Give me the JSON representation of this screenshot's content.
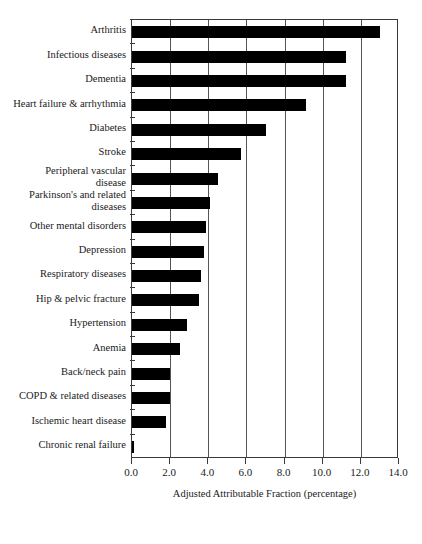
{
  "chart_data": {
    "type": "bar",
    "orientation": "horizontal",
    "title": "",
    "xlabel": "Adjusted Attributable Fraction (percentage)",
    "ylabel": "",
    "xlim": [
      0.0,
      14.0
    ],
    "xticks": [
      "0.0",
      "2.0",
      "4.0",
      "6.0",
      "8.0",
      "10.0",
      "12.0",
      "14.0"
    ],
    "xtick_values": [
      0.0,
      2.0,
      4.0,
      6.0,
      8.0,
      10.0,
      12.0,
      14.0
    ],
    "grid": "vertical",
    "legend": "none",
    "bar_color": "#000000",
    "categories": [
      "Arthritis",
      "Infectious diseases",
      "Dementia",
      "Heart failure & arrhythmia",
      "Diabetes",
      "Stroke",
      "Peripheral vascular\ndisease",
      "Parkinson's and related\ndiseases",
      "Other mental disorders",
      "Depression",
      "Respiratory diseases",
      "Hip & pelvic fracture",
      "Hypertension",
      "Anemia",
      "Back/neck pain",
      "COPD & related diseases",
      "Ischemic heart disease",
      "Chronic renal failure"
    ],
    "values": [
      13.0,
      11.2,
      11.2,
      9.1,
      7.0,
      5.7,
      4.5,
      4.1,
      3.9,
      3.8,
      3.6,
      3.5,
      2.9,
      2.5,
      2.0,
      2.0,
      1.8,
      0.0
    ]
  }
}
